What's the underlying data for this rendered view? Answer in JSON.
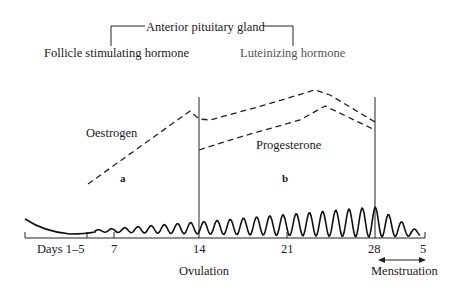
{
  "header": {
    "group_label": "Anterior pituitary gland",
    "fsh_label": "Follicle stimulating hormone",
    "lh_label": "Luteinizing hormone"
  },
  "curves": {
    "oestrogen_label": "Oestrogen",
    "progesterone_label": "Progesterone",
    "phase_a_label": "a",
    "phase_b_label": "b"
  },
  "axis": {
    "ticks": [
      "Days 1–5",
      "7",
      "14",
      "21",
      "28",
      "5"
    ],
    "ovulation_label": "Ovulation",
    "menstruation_label": "Menstruation"
  },
  "chart_data": {
    "type": "line",
    "x_ticks": [
      "Days 1-5",
      "7",
      "14",
      "21",
      "28",
      "5"
    ],
    "markers": [
      {
        "day": 14,
        "label": "Ovulation"
      },
      {
        "day": 28,
        "label": "Menstruation start"
      }
    ],
    "series": [
      {
        "name": "Oestrogen",
        "style": "dashed",
        "shape": "rises from day ~5 to peak before day 14, dips slightly, rises to second peak ~day 24, falls by day 28"
      },
      {
        "name": "Progesterone",
        "style": "dashed",
        "shape": "starts at ovulation (day 14), rises to peak ~day 24, falls by day 28"
      },
      {
        "name": "Endometrium thickness",
        "style": "wavy solid",
        "shape": "low after menstruation, thickens through days 7-28, sheds days 28-5"
      }
    ],
    "annotations": [
      "a",
      "b",
      "Anterior pituitary gland",
      "Follicle stimulating hormone",
      "Luteinizing hormone"
    ]
  }
}
